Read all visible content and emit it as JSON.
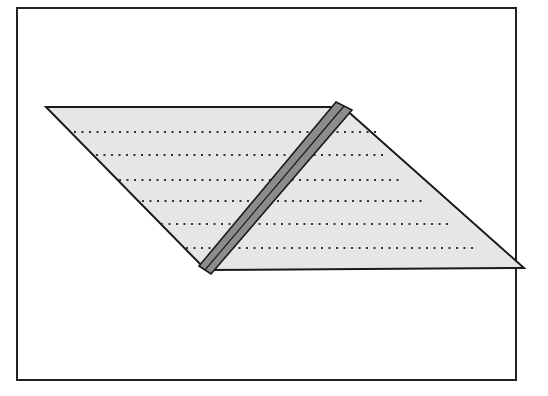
{
  "figure": {
    "colors": {
      "background": "#ffffff",
      "frame": "#222222",
      "sheet_fill": "#e6e6e6",
      "sheet_outline": "#1a1a1a",
      "strip_fill": "#8c8c8c",
      "strip_outline": "#1a1a1a",
      "dots": "#333333"
    },
    "frame": {
      "x": 17,
      "y": 8,
      "width": 499,
      "height": 372
    },
    "parallelogram": {
      "points": "46,107 343,107 524,268 206,270"
    },
    "strip": {
      "points": "336,102 352,110 211,274 199,266",
      "center_line": "344,106 205,270"
    },
    "dotted_rows": [
      {
        "y": 132,
        "x1": 74,
        "x2": 378
      },
      {
        "y": 155,
        "x1": 96,
        "x2": 385
      },
      {
        "y": 180,
        "x1": 119,
        "x2": 404
      },
      {
        "y": 201,
        "x1": 142,
        "x2": 425
      },
      {
        "y": 224,
        "x1": 161,
        "x2": 450
      },
      {
        "y": 248,
        "x1": 186,
        "x2": 475
      }
    ]
  }
}
